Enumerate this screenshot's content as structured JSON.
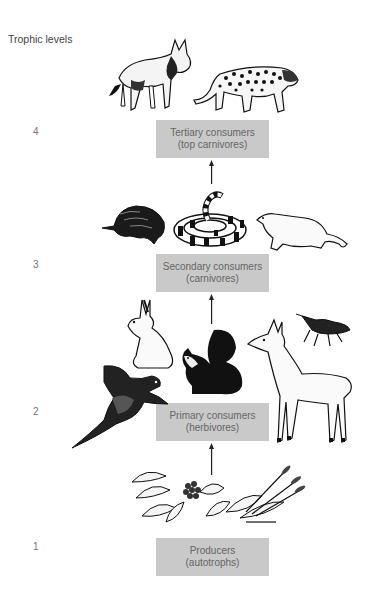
{
  "diagram": {
    "heading": "Trophic levels",
    "levels": [
      {
        "number": "4",
        "title": "Tertiary consumers",
        "subtitle": "(top carnivores)",
        "organisms": [
          "wolf",
          "jaguar"
        ]
      },
      {
        "number": "3",
        "title": "Secondary consumers",
        "subtitle": "(carnivores)",
        "organisms": [
          "mole",
          "banded snake",
          "weasel"
        ]
      },
      {
        "number": "2",
        "title": "Primary consumers",
        "subtitle": "(herbivores)",
        "organisms": [
          "rabbit",
          "pheasant",
          "squirrel",
          "deer",
          "grasshopper"
        ]
      },
      {
        "number": "1",
        "title": "Producers",
        "subtitle": "(autotrophs)",
        "organisms": [
          "plants",
          "grasses"
        ]
      }
    ],
    "colors": {
      "box": "#c9c9c9",
      "box_text": "#666666",
      "arrow": "#222222",
      "ink": "#111111"
    }
  }
}
